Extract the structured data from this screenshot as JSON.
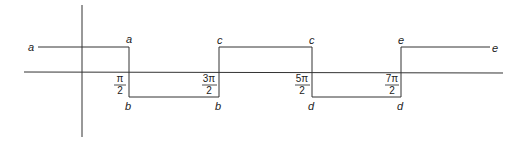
{
  "diagram": {
    "type": "step-function",
    "axes": {
      "x_axis": {
        "x1": 24,
        "x2": 503,
        "y": 72
      },
      "y_axis": {
        "x": 82,
        "y1": 5,
        "y2": 137
      }
    },
    "levels": {
      "high_y": 47,
      "low_y": 97
    },
    "segments": [
      {
        "from_label": "a",
        "to_label": "a",
        "level": "high",
        "x1": 38,
        "x2": 129
      },
      {
        "from_label": "b",
        "to_label": "b",
        "level": "low",
        "x1": 129,
        "x2": 219
      },
      {
        "from_label": "c",
        "to_label": "c",
        "level": "high",
        "x1": 219,
        "x2": 312
      },
      {
        "from_label": "d",
        "to_label": "d",
        "level": "low",
        "x1": 312,
        "x2": 401
      },
      {
        "from_label": "e",
        "to_label": "e",
        "level": "high",
        "x1": 401,
        "x2": 490
      }
    ],
    "tick_labels": [
      {
        "numerator": "π",
        "denominator": "2",
        "x": 129
      },
      {
        "numerator": "3π",
        "denominator": "2",
        "x": 219
      },
      {
        "numerator": "5π",
        "denominator": "2",
        "x": 312
      },
      {
        "numerator": "7π",
        "denominator": "2",
        "x": 401
      }
    ],
    "point_labels": {
      "a_left": "a",
      "a_top": "a",
      "b_left": "b",
      "b_right": "b",
      "c_left": "c",
      "c_right": "c",
      "d_left": "d",
      "d_right": "d",
      "e_left": "e",
      "e_right": "e"
    }
  }
}
